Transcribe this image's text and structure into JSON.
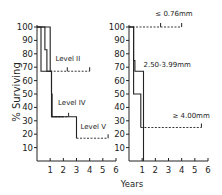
{
  "chart_data": [
    {
      "type": "line",
      "subtype": "kaplan-meier-step",
      "title": "",
      "xlabel": "Years",
      "ylabel": "% Surviving",
      "xlim": [
        0,
        6
      ],
      "ylim": [
        0,
        100
      ],
      "xticks": [
        1,
        2,
        3,
        4,
        5,
        6
      ],
      "yticks": [
        10,
        20,
        30,
        40,
        50,
        60,
        70,
        80,
        90,
        100
      ],
      "grid": false,
      "series": [
        {
          "name": "Level II",
          "steps": [
            [
              0,
              100
            ],
            [
              0.6,
              100
            ],
            [
              0.6,
              83
            ],
            [
              0.75,
              83
            ],
            [
              0.75,
              67
            ],
            [
              1.0,
              67
            ]
          ],
          "censored_tail": [
            [
              1.0,
              67
            ],
            [
              4.0,
              67
            ]
          ],
          "censor_marks": [
            2.3,
            4.0
          ],
          "label_pos": [
            1.4,
            75
          ]
        },
        {
          "name": "Level IV",
          "steps": [
            [
              0,
              100
            ],
            [
              0.3,
              100
            ],
            [
              0.3,
              67
            ],
            [
              1.1,
              67
            ],
            [
              1.1,
              33
            ],
            [
              2.0,
              33
            ]
          ],
          "censored_tail": [
            [
              1.1,
              33
            ],
            [
              2.4,
              33
            ]
          ],
          "censor_marks": [
            2.4
          ],
          "label_pos": [
            1.6,
            42
          ]
        },
        {
          "name": "Level V",
          "steps": [
            [
              0,
              100
            ],
            [
              1.0,
              100
            ],
            [
              1.0,
              67
            ],
            [
              1.1,
              67
            ],
            [
              1.1,
              50
            ],
            [
              1.15,
              50
            ],
            [
              1.15,
              33
            ],
            [
              3.0,
              33
            ],
            [
              3.0,
              17
            ]
          ],
          "censored_tail": [
            [
              3.0,
              17
            ],
            [
              5.4,
              17
            ]
          ],
          "censor_marks": [
            5.4
          ],
          "label_pos": [
            3.3,
            24
          ]
        }
      ]
    },
    {
      "type": "line",
      "subtype": "kaplan-meier-step",
      "title": "",
      "xlabel": "Years",
      "ylabel": "",
      "xlim": [
        0,
        6
      ],
      "ylim": [
        0,
        100
      ],
      "xticks": [
        1,
        2,
        3,
        4,
        5,
        6
      ],
      "yticks": [
        10,
        20,
        30,
        40,
        50,
        60,
        70,
        80,
        90,
        100
      ],
      "grid": false,
      "series": [
        {
          "name": "≤ 0.76mm",
          "steps": [],
          "censored_tail": [
            [
              0,
              100
            ],
            [
              4.0,
              100
            ]
          ],
          "censor_marks": [
            2.4,
            4.0
          ],
          "label_pos": [
            2.0,
            108
          ]
        },
        {
          "name": "2.50-3.99mm",
          "steps": [
            [
              0,
              100
            ],
            [
              0.35,
              100
            ],
            [
              0.35,
              75
            ],
            [
              0.45,
              75
            ],
            [
              0.45,
              67
            ],
            [
              1.1,
              67
            ],
            [
              1.1,
              0
            ]
          ],
          "censored_tail": [],
          "censor_marks": [],
          "label_pos": [
            1.1,
            70
          ]
        },
        {
          "name": "≥ 4.00mm",
          "steps": [
            [
              0,
              100
            ],
            [
              0.35,
              100
            ],
            [
              0.35,
              50
            ],
            [
              0.9,
              50
            ],
            [
              0.9,
              25
            ]
          ],
          "censored_tail": [
            [
              0.9,
              25
            ],
            [
              5.5,
              25
            ]
          ],
          "censor_marks": [
            5.5
          ],
          "label_pos": [
            3.3,
            32
          ]
        }
      ]
    }
  ],
  "axis": {
    "ylabel": "% Surviving",
    "xlabel": "Years"
  }
}
